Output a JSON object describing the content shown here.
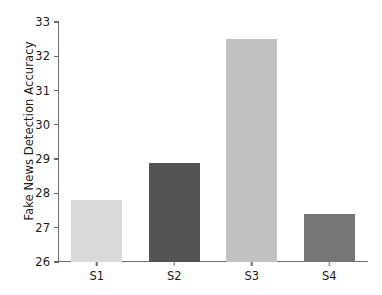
{
  "chart_data": {
    "type": "bar",
    "title": "",
    "subtitle": "",
    "xlabel": "",
    "ylabel": "Fake News Detection Accuracy",
    "categories": [
      "S1",
      "S2",
      "S3",
      "S4"
    ],
    "values": [
      27.8,
      28.9,
      32.5,
      27.4
    ],
    "series": [
      {
        "name": "Fake News Detection Accuracy",
        "values": [
          27.8,
          28.9,
          32.5,
          27.4
        ]
      }
    ],
    "bar_colors": [
      "#d9d9d9",
      "#545454",
      "#c2c2c2",
      "#767676"
    ],
    "ylim": [
      26,
      33
    ],
    "yticks": [
      26,
      27,
      28,
      29,
      30,
      31,
      32,
      33
    ],
    "ytick_labels": [
      "26",
      "27",
      "28",
      "29",
      "30",
      "31",
      "32",
      "33"
    ],
    "xtick_labels": [
      "S1",
      "S2",
      "S3",
      "S4"
    ],
    "grid": false,
    "legend": false,
    "legend_position": "none",
    "spines": [
      "left",
      "bottom"
    ],
    "background_color": "#ffffff",
    "axis_color": "#6b6b6b",
    "text_color": "#1a1a1a"
  }
}
